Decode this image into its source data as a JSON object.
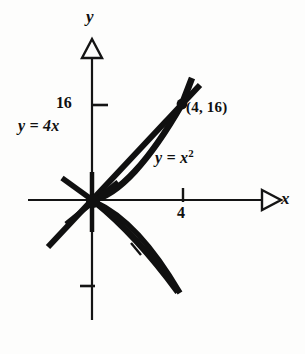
{
  "figure": {
    "kind": "math-graph",
    "background_color": "#fdfdfc",
    "ink_color": "#101010"
  },
  "axes": {
    "x_axis_label": "x",
    "y_axis_label": "y",
    "origin_px": {
      "x": 92,
      "y": 200
    },
    "x_axis_span_px": {
      "from": 28,
      "to": 264
    },
    "y_axis_span_px": {
      "from": 48,
      "to": 320
    },
    "arrowhead_style": "hollow-triangle",
    "ticks": {
      "x": [
        {
          "label": "4",
          "value": 4,
          "px": 183
        }
      ],
      "y": [
        {
          "label": "16",
          "value": 16,
          "px": 105
        },
        {
          "label": "",
          "value": -8,
          "px": 285
        }
      ]
    }
  },
  "curves": [
    {
      "name": "line",
      "equation_label": "y = 4x",
      "equation_lhs": "y",
      "equation_rhs": "4x",
      "slope": 4
    },
    {
      "name": "parabola",
      "equation_label": "y = x",
      "equation_lhs": "y",
      "equation_rhs": "x",
      "exponent": "2"
    }
  ],
  "points": [
    {
      "name": "intersection",
      "label": "(4, 16)",
      "x": 4,
      "y": 16,
      "px": {
        "x": 182,
        "y": 104
      }
    },
    {
      "name": "origin",
      "label": "",
      "x": 0,
      "y": 0,
      "px": {
        "x": 92,
        "y": 200
      }
    }
  ],
  "shaded_region": {
    "name": "area-between-curves",
    "fill_style": "stipple-crosshatch",
    "bounds": "between y = 4x and y = x^2 from x = 0 to x = 4",
    "quadrant": "I"
  },
  "secondary_region": {
    "name": "mirrored-lens",
    "fill_style": "none",
    "quadrant": "IV"
  },
  "labels": {
    "equation_line": "y = 4x",
    "equation_parabola_base": "y = x",
    "equation_parabola_exponent": "2",
    "point_label": "(4, 16)",
    "tick_x_4": "4",
    "tick_y_16": "16",
    "axis_x": "x",
    "axis_y": "y"
  }
}
